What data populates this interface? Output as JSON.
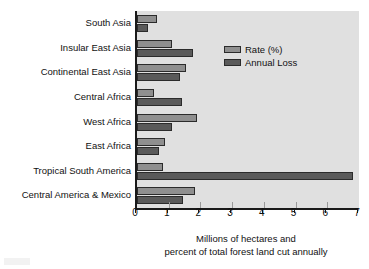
{
  "chart_data": {
    "type": "bar",
    "orientation": "horizontal",
    "title": "",
    "xlabel": "Millions of hectares and percent of total forest land cut annually",
    "ylabel": "",
    "xlim": [
      0,
      7
    ],
    "xticks": [
      "0",
      "1",
      "2",
      "3",
      "4",
      "5",
      "6",
      "7"
    ],
    "grid": false,
    "legend_position": "top-right",
    "categories": [
      "South Asia",
      "Insular East Asia",
      "Continental East Asia",
      "Central Africa",
      "West Africa",
      "East Africa",
      "Tropical South America",
      "Central America & Mexico"
    ],
    "series": [
      {
        "name": "Rate (%)",
        "color": "#8f8f8f",
        "values": [
          0.63,
          1.1,
          1.55,
          0.55,
          1.9,
          0.87,
          0.83,
          1.83
        ]
      },
      {
        "name": "Annual Loss",
        "color": "#5a5a5a",
        "values": [
          0.36,
          1.75,
          1.35,
          1.42,
          1.1,
          0.7,
          6.8,
          1.45
        ]
      }
    ]
  },
  "axis_title": {
    "line1": "Millions of hectares and",
    "line2": "percent of total forest land cut annually"
  },
  "legend": {
    "items": [
      {
        "label": "Rate (%)"
      },
      {
        "label": "Annual Loss"
      }
    ]
  },
  "colors": {
    "plot_background": "#e0e0e0",
    "rate_bar": "#8f8f8f",
    "loss_bar": "#5a5a5a",
    "axis": "#1a1a1a",
    "text": "#111111"
  }
}
